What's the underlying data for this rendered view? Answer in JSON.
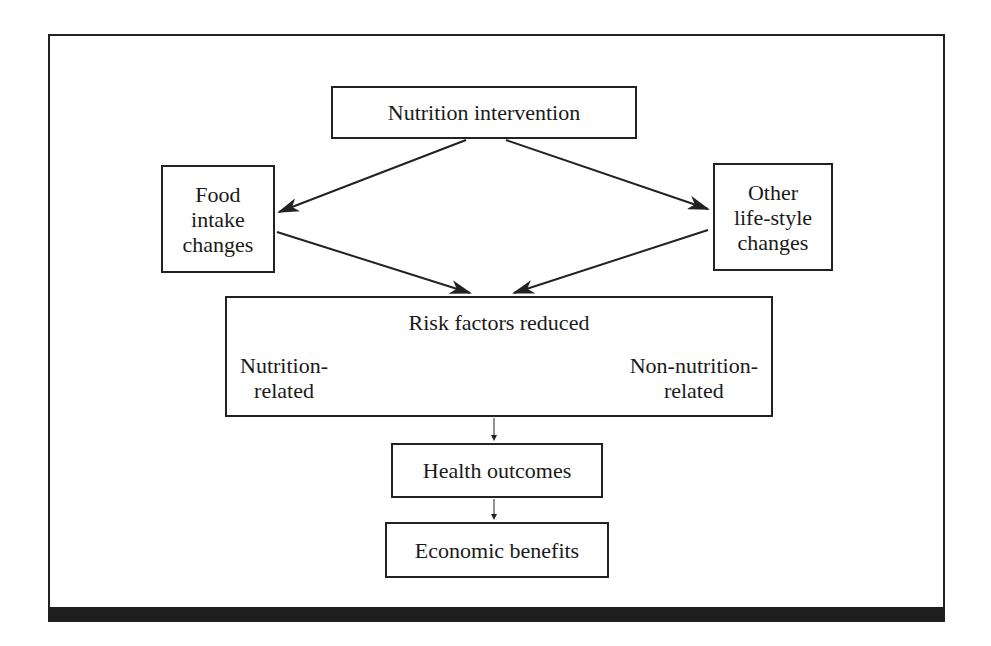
{
  "diagram": {
    "nodes": {
      "nutrition_intervention": {
        "label": "Nutrition intervention"
      },
      "food_intake_changes": {
        "lines": [
          "Food",
          "intake",
          "changes"
        ]
      },
      "other_lifestyle_changes": {
        "lines": [
          "Other",
          "life-style",
          "changes"
        ]
      },
      "risk_factors": {
        "title": "Risk factors reduced",
        "left": [
          "Nutrition-",
          "related"
        ],
        "right": [
          "Non-nutrition-",
          "related"
        ]
      },
      "health_outcomes": {
        "label": "Health outcomes"
      },
      "economic_benefits": {
        "label": "Economic benefits"
      }
    },
    "edges": [
      {
        "from": "Nutrition intervention",
        "to": "Food intake changes"
      },
      {
        "from": "Nutrition intervention",
        "to": "Other life-style changes"
      },
      {
        "from": "Food intake changes",
        "to": "Risk factors reduced"
      },
      {
        "from": "Other life-style changes",
        "to": "Risk factors reduced"
      },
      {
        "from": "Risk factors reduced",
        "to": "Health outcomes"
      },
      {
        "from": "Health outcomes",
        "to": "Economic benefits"
      }
    ],
    "colors": {
      "line": "#222222",
      "background": "#ffffff",
      "bottom_bar": "#1e1e1e"
    }
  }
}
